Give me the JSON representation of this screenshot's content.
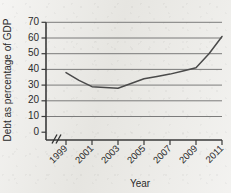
{
  "chart_data": {
    "type": "line",
    "title": "",
    "xlabel": "Year",
    "ylabel": "Debt as percentage of GDP",
    "x": [
      1999,
      2000,
      2001,
      2002,
      2003,
      2004,
      2005,
      2006,
      2007,
      2008,
      2009,
      2010,
      2011
    ],
    "values": [
      38,
      33,
      29,
      28.5,
      28,
      31,
      34,
      35.5,
      37,
      39,
      41,
      50,
      61
    ],
    "series": [
      {
        "name": "Debt as percentage of GDP",
        "values": [
          38,
          33,
          29,
          28.5,
          28,
          31,
          34,
          35.5,
          37,
          39,
          41,
          50,
          61
        ]
      }
    ],
    "xtick_labels": [
      "1999",
      "2001",
      "2003",
      "2005",
      "2007",
      "2009",
      "2011"
    ],
    "xtick_values": [
      1999,
      2001,
      2003,
      2005,
      2007,
      2009,
      2011
    ],
    "ytick_labels": [
      "0",
      "10",
      "20",
      "30",
      "40",
      "50",
      "60",
      "70"
    ],
    "ytick_values": [
      0,
      10,
      20,
      30,
      40,
      50,
      60,
      70
    ],
    "ylim": [
      0,
      70
    ],
    "xlim": [
      1999,
      2011
    ],
    "grid": true,
    "grid_axis": "y",
    "legend": false,
    "axis_break": "//",
    "line_color": "#4a4a4a",
    "grid_color": "#6e6e6e",
    "axis_color": "#3a3a3a",
    "background_color": "#e9e8e4"
  },
  "labels": {
    "y_axis_title": "Debt as percentage of GDP",
    "x_axis_title": "Year",
    "ytick_0": "0",
    "ytick_1": "10",
    "ytick_2": "20",
    "ytick_3": "30",
    "ytick_4": "40",
    "ytick_5": "50",
    "ytick_6": "60",
    "ytick_7": "70",
    "xtick_0": "1999",
    "xtick_1": "2001",
    "xtick_2": "2003",
    "xtick_3": "2005",
    "xtick_4": "2007",
    "xtick_5": "2009",
    "xtick_6": "2011"
  }
}
